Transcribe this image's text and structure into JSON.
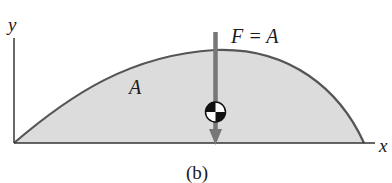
{
  "diagram": {
    "caption": "(b)",
    "axes": {
      "x_label": "x",
      "y_label": "y"
    },
    "region_label": "A",
    "force_label": "F = A",
    "centroid_symbol": "centroid-marker",
    "colors": {
      "fill": "#dcdcdc",
      "curve": "#555555",
      "axis": "#333333",
      "arrow": "#777777",
      "text": "#1a1a1a"
    }
  }
}
